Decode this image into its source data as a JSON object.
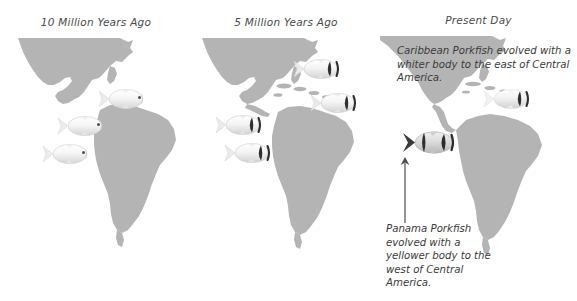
{
  "figure": {
    "title_caption": "",
    "background_color": "#ffffff",
    "land_color": "#b4b4b4",
    "text_color": "#3b3b3b"
  },
  "panels": [
    {
      "id": "past",
      "title": "10 Million Years Ago",
      "seaway": "open",
      "fish_count": 3,
      "fish_type": "ancestral-porkfish",
      "fish_description": "pale unstriped ancestral porkfish swimming through the open Central American seaway"
    },
    {
      "id": "mid",
      "title": "5 Million Years Ago",
      "seaway": "partial-island-chain",
      "fish_count": 4,
      "fish_type": "striped-porkfish",
      "fish_description": "striped porkfish on both sides of the emerging island chain"
    },
    {
      "id": "now",
      "title": "Present Day",
      "seaway": "closed-isthmus",
      "fish_count": 2,
      "fish_type": "split-species",
      "fish_description": "one whiter Caribbean porkfish east and one yellower Panama porkfish west"
    }
  ],
  "callouts": {
    "caribbean": "Caribbean Porkfish evolved with a whiter body to the east of Central America.",
    "panama": "Panama Porkfish evolved with a yellower body to the west of Central America."
  },
  "annotations": {
    "arrow_label": "arrow pointing from the Panama Porkfish caption up to the Panama Porkfish"
  },
  "fish_markers": {
    "past": [
      {
        "name": "ancestral-porkfish-1",
        "x": 96,
        "y": 86,
        "scale": 1.0
      },
      {
        "name": "ancestral-porkfish-2",
        "x": 55,
        "y": 113,
        "scale": 1.0
      },
      {
        "name": "ancestral-porkfish-3",
        "x": 40,
        "y": 141,
        "scale": 1.0
      }
    ],
    "mid": [
      {
        "name": "striped-porkfish-1",
        "x": 99,
        "y": 56,
        "scale": 1.0
      },
      {
        "name": "striped-porkfish-2",
        "x": 116,
        "y": 90,
        "scale": 1.0
      },
      {
        "name": "striped-porkfish-3",
        "x": 21,
        "y": 112,
        "scale": 1.0
      },
      {
        "name": "striped-porkfish-4",
        "x": 30,
        "y": 140,
        "scale": 1.0
      }
    ],
    "now": [
      {
        "name": "caribbean-porkfish",
        "x": 101,
        "y": 86,
        "scale": 1.0
      },
      {
        "name": "panama-porkfish",
        "x": 20,
        "y": 128,
        "scale": 1.1
      }
    ]
  }
}
